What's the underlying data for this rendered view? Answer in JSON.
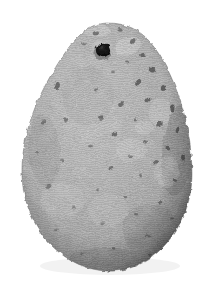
{
  "figure": {
    "domain": "Natural-Image",
    "medium": "grayscale photograph",
    "subject_name": "perforated teardrop stone artifact",
    "alt_text": "Grayscale photograph of a pear-shaped pitted stone artifact with a single drilled perforation near its narrow upper end, shown against a plain white background.",
    "canvas": {
      "width": 218,
      "height": 285
    },
    "background_color": "#ffffff"
  },
  "artifact": {
    "name": "pear-shaped perforated stone",
    "silhouette": {
      "description": "teardrop / pear outline, narrow rounded apex at top, broadest low on the body, rounded base",
      "top_y": 23,
      "bottom_y": 269,
      "left_x": 22,
      "right_x": 192,
      "widest_y": 186,
      "apex_center_x": 108,
      "apex_half_width": 32
    },
    "body_colors": {
      "base": "#a9a9a9",
      "light": "#c8c8c8",
      "highlight": "#dcdcdc",
      "mid": "#9b9b9b",
      "shadow": "#7a7a7a",
      "deep_shadow": "#5c5c5c",
      "outline": "#6e6e6e"
    },
    "surface_texture": {
      "type": "vesicular pitted stone with fine photographic grain and horizontal halftone scan lines",
      "grain_opacity": 0.38,
      "scanline_spacing_px": 2,
      "pit_count": 46,
      "pit_color": "#3a3a3a",
      "pit_density_note": "pits concentrated along the upper-right flank and right margin, sparser on the smoother lower-left"
    },
    "perforation": {
      "label": "drilled suspension hole",
      "center_x": 103,
      "center_y": 50,
      "bore_radius": 7.2,
      "bore_color": "#141414",
      "countersink_radius": 11.5,
      "countersink_color": "#b8b8b8",
      "rim_shadow_color": "#4a4a4a"
    },
    "pits": [
      {
        "cx": 96,
        "cy": 33,
        "rx": 3.4,
        "ry": 2.2,
        "rot": -18,
        "o": 0.52
      },
      {
        "cx": 120,
        "cy": 30,
        "rx": 2.6,
        "ry": 1.8,
        "rot": 10,
        "o": 0.46
      },
      {
        "cx": 133,
        "cy": 41,
        "rx": 2.2,
        "ry": 3.0,
        "rot": 28,
        "o": 0.55
      },
      {
        "cx": 84,
        "cy": 44,
        "rx": 2.0,
        "ry": 1.5,
        "rot": 0,
        "o": 0.4
      },
      {
        "cx": 143,
        "cy": 55,
        "rx": 2.8,
        "ry": 2.0,
        "rot": -12,
        "o": 0.58
      },
      {
        "cx": 127,
        "cy": 62,
        "rx": 2.1,
        "ry": 1.6,
        "rot": 0,
        "o": 0.44
      },
      {
        "cx": 152,
        "cy": 70,
        "rx": 3.2,
        "ry": 2.3,
        "rot": 22,
        "o": 0.62
      },
      {
        "cx": 113,
        "cy": 72,
        "rx": 1.9,
        "ry": 1.4,
        "rot": 0,
        "o": 0.4
      },
      {
        "cx": 138,
        "cy": 83,
        "rx": 2.4,
        "ry": 3.4,
        "rot": 35,
        "o": 0.6
      },
      {
        "cx": 163,
        "cy": 88,
        "rx": 2.2,
        "ry": 3.0,
        "rot": 18,
        "o": 0.64
      },
      {
        "cx": 96,
        "cy": 90,
        "rx": 2.0,
        "ry": 1.5,
        "rot": 0,
        "o": 0.42
      },
      {
        "cx": 57,
        "cy": 86,
        "rx": 2.8,
        "ry": 4.0,
        "rot": 12,
        "o": 0.56
      },
      {
        "cx": 148,
        "cy": 100,
        "rx": 2.6,
        "ry": 2.0,
        "rot": -20,
        "o": 0.58
      },
      {
        "cx": 121,
        "cy": 104,
        "rx": 2.3,
        "ry": 3.2,
        "rot": 40,
        "o": 0.54
      },
      {
        "cx": 172,
        "cy": 108,
        "rx": 2.4,
        "ry": 3.6,
        "rot": 15,
        "o": 0.66
      },
      {
        "cx": 101,
        "cy": 118,
        "rx": 2.1,
        "ry": 2.8,
        "rot": 8,
        "o": 0.5
      },
      {
        "cx": 135,
        "cy": 120,
        "rx": 2.0,
        "ry": 1.6,
        "rot": 0,
        "o": 0.46
      },
      {
        "cx": 159,
        "cy": 124,
        "rx": 2.8,
        "ry": 2.1,
        "rot": -25,
        "o": 0.6
      },
      {
        "cx": 44,
        "cy": 122,
        "rx": 2.2,
        "ry": 1.7,
        "rot": 0,
        "o": 0.44
      },
      {
        "cx": 178,
        "cy": 130,
        "rx": 2.0,
        "ry": 3.2,
        "rot": 20,
        "o": 0.62
      },
      {
        "cx": 115,
        "cy": 134,
        "rx": 2.4,
        "ry": 2.4,
        "rot": 0,
        "o": 0.56
      },
      {
        "cx": 145,
        "cy": 142,
        "rx": 2.1,
        "ry": 1.7,
        "rot": 0,
        "o": 0.48
      },
      {
        "cx": 168,
        "cy": 148,
        "rx": 2.6,
        "ry": 2.0,
        "rot": 30,
        "o": 0.58
      },
      {
        "cx": 90,
        "cy": 146,
        "rx": 1.9,
        "ry": 1.5,
        "rot": 0,
        "o": 0.4
      },
      {
        "cx": 130,
        "cy": 156,
        "rx": 2.0,
        "ry": 1.6,
        "rot": 0,
        "o": 0.44
      },
      {
        "cx": 156,
        "cy": 162,
        "rx": 2.2,
        "ry": 1.8,
        "rot": -15,
        "o": 0.52
      },
      {
        "cx": 183,
        "cy": 158,
        "rx": 2.0,
        "ry": 2.6,
        "rot": 12,
        "o": 0.6
      },
      {
        "cx": 111,
        "cy": 168,
        "rx": 2.3,
        "ry": 1.8,
        "rot": 0,
        "o": 0.5
      },
      {
        "cx": 62,
        "cy": 160,
        "rx": 2.0,
        "ry": 1.6,
        "rot": 0,
        "o": 0.38
      },
      {
        "cx": 140,
        "cy": 176,
        "rx": 1.9,
        "ry": 1.5,
        "rot": 0,
        "o": 0.44
      },
      {
        "cx": 175,
        "cy": 180,
        "rx": 2.2,
        "ry": 1.8,
        "rot": 20,
        "o": 0.54
      },
      {
        "cx": 49,
        "cy": 186,
        "rx": 2.6,
        "ry": 2.0,
        "rot": -10,
        "o": 0.42
      },
      {
        "cx": 98,
        "cy": 190,
        "rx": 1.8,
        "ry": 1.4,
        "rot": 0,
        "o": 0.38
      },
      {
        "cx": 125,
        "cy": 196,
        "rx": 2.0,
        "ry": 1.6,
        "rot": 0,
        "o": 0.42
      },
      {
        "cx": 160,
        "cy": 202,
        "rx": 2.1,
        "ry": 1.7,
        "rot": 0,
        "o": 0.48
      },
      {
        "cx": 74,
        "cy": 208,
        "rx": 1.9,
        "ry": 1.5,
        "rot": 0,
        "o": 0.36
      },
      {
        "cx": 136,
        "cy": 214,
        "rx": 2.0,
        "ry": 1.6,
        "rot": 0,
        "o": 0.42
      },
      {
        "cx": 172,
        "cy": 218,
        "rx": 2.0,
        "ry": 1.6,
        "rot": 0,
        "o": 0.46
      },
      {
        "cx": 103,
        "cy": 224,
        "rx": 1.8,
        "ry": 1.4,
        "rot": 0,
        "o": 0.36
      },
      {
        "cx": 57,
        "cy": 230,
        "rx": 1.9,
        "ry": 1.5,
        "rot": 0,
        "o": 0.34
      },
      {
        "cx": 148,
        "cy": 236,
        "rx": 2.0,
        "ry": 1.6,
        "rot": 0,
        "o": 0.42
      },
      {
        "cx": 114,
        "cy": 248,
        "rx": 2.2,
        "ry": 1.7,
        "rot": 0,
        "o": 0.44
      },
      {
        "cx": 82,
        "cy": 254,
        "rx": 1.8,
        "ry": 1.4,
        "rot": 0,
        "o": 0.34
      },
      {
        "cx": 150,
        "cy": 255,
        "rx": 1.9,
        "ry": 1.5,
        "rot": 0,
        "o": 0.38
      },
      {
        "cx": 66,
        "cy": 120,
        "rx": 2.0,
        "ry": 2.8,
        "rot": -8,
        "o": 0.46
      },
      {
        "cx": 37,
        "cy": 152,
        "rx": 2.0,
        "ry": 1.6,
        "rot": 0,
        "o": 0.36
      }
    ],
    "light_patches": [
      {
        "cx": 128,
        "cy": 46,
        "rx": 13,
        "ry": 9,
        "rot": -20,
        "o": 0.34
      },
      {
        "cx": 96,
        "cy": 30,
        "rx": 14,
        "ry": 7,
        "rot": 5,
        "o": 0.3
      },
      {
        "cx": 160,
        "cy": 112,
        "rx": 11,
        "ry": 14,
        "rot": 14,
        "o": 0.26
      },
      {
        "cx": 131,
        "cy": 150,
        "rx": 16,
        "ry": 12,
        "rot": -10,
        "o": 0.24
      },
      {
        "cx": 167,
        "cy": 172,
        "rx": 12,
        "ry": 16,
        "rot": 8,
        "o": 0.22
      },
      {
        "cx": 62,
        "cy": 200,
        "rx": 22,
        "ry": 18,
        "rot": 0,
        "o": 0.2
      },
      {
        "cx": 108,
        "cy": 210,
        "rx": 20,
        "ry": 16,
        "rot": 0,
        "o": 0.18
      },
      {
        "cx": 144,
        "cy": 128,
        "rx": 9,
        "ry": 7,
        "rot": 0,
        "o": 0.26
      }
    ],
    "dark_patches": [
      {
        "cx": 178,
        "cy": 150,
        "rx": 16,
        "ry": 46,
        "rot": 6,
        "o": 0.26
      },
      {
        "cx": 150,
        "cy": 230,
        "rx": 28,
        "ry": 26,
        "rot": 0,
        "o": 0.18
      },
      {
        "cx": 44,
        "cy": 150,
        "rx": 16,
        "ry": 36,
        "rot": -4,
        "o": 0.16
      },
      {
        "cx": 108,
        "cy": 262,
        "rx": 42,
        "ry": 14,
        "rot": 0,
        "o": 0.2
      },
      {
        "cx": 88,
        "cy": 96,
        "rx": 26,
        "ry": 30,
        "rot": 0,
        "o": 0.12
      }
    ]
  }
}
